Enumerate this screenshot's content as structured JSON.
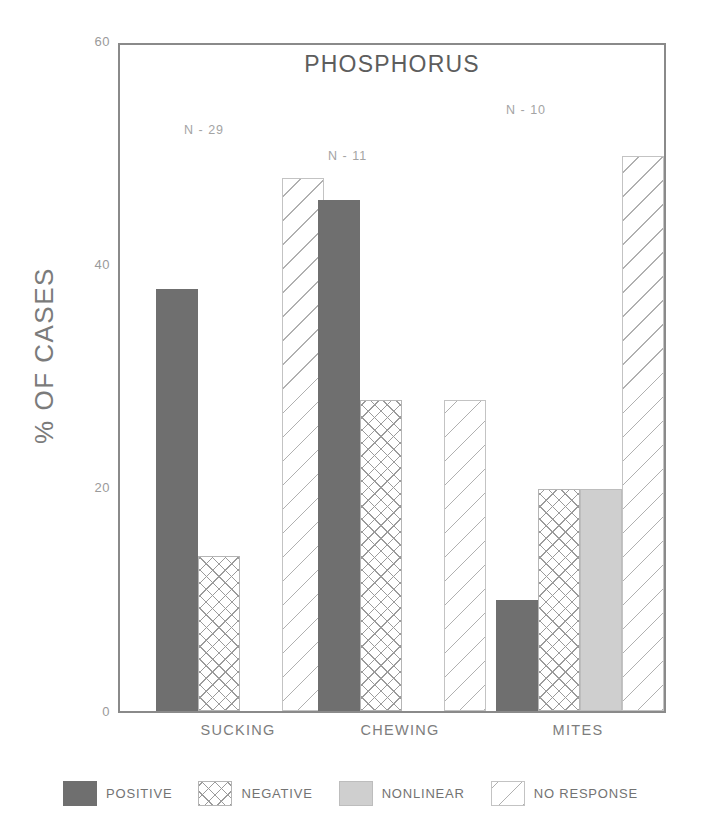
{
  "chart_data": {
    "type": "bar",
    "title": "PHOSPHORUS",
    "xlabel": "",
    "ylabel": "% OF CASES",
    "categories": [
      "SUCKING",
      "CHEWING",
      "MITES"
    ],
    "yticks": [
      0,
      20,
      40,
      60
    ],
    "ylim": [
      0,
      60
    ],
    "grid": false,
    "legend_position": "bottom",
    "series": [
      {
        "name": "POSITIVE",
        "pattern": "solid-dark",
        "color": "#6f6f6f",
        "values": [
          38,
          46,
          10
        ]
      },
      {
        "name": "NEGATIVE",
        "pattern": "crosshatch",
        "color": "#9b9b9b",
        "values": [
          14,
          28,
          20
        ]
      },
      {
        "name": "NONLINEAR",
        "pattern": "solid-light",
        "color": "#cfcfcf",
        "values": [
          0,
          0,
          20
        ]
      },
      {
        "name": "NO RESPONSE",
        "pattern": "diagonal",
        "color": "#b0b0b0",
        "values": [
          48,
          28,
          50
        ]
      }
    ],
    "annotations": [
      {
        "text": "N - 29",
        "category": "SUCKING"
      },
      {
        "text": "N - 11",
        "category": "CHEWING"
      },
      {
        "text": "N - 10",
        "category": "MITES"
      }
    ]
  },
  "axis": {
    "y_title": "% OF CASES",
    "y_tick_0": "0",
    "y_tick_20": "20",
    "y_tick_40": "40",
    "y_tick_60": "60",
    "x_tick_0": "SUCKING",
    "x_tick_1": "CHEWING",
    "x_tick_2": "MITES"
  },
  "title": "PHOSPHORUS",
  "annotations": {
    "n_sucking": "N - 29",
    "n_chewing": "N - 11",
    "n_mites": "N - 10"
  },
  "legend": {
    "items": [
      {
        "label": "POSITIVE"
      },
      {
        "label": "NEGATIVE"
      },
      {
        "label": "NONLINEAR"
      },
      {
        "label": "NO RESPONSE"
      }
    ]
  }
}
